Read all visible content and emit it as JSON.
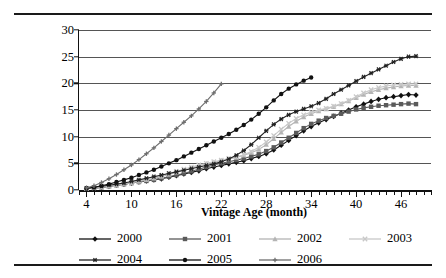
{
  "figure": {
    "ylabel": "OTS 60+DQ% (including foreclosure, REO, and bankruptcy)",
    "xlabel": "Vintage Age (month)"
  },
  "chart_data": {
    "type": "line",
    "title": "",
    "subtitle": "",
    "xlabel": "Vintage Age (month)",
    "ylabel": "OTS 60+DQ% (including foreclosure, REO, and bankruptcy)",
    "xlim": [
      3,
      50
    ],
    "ylim": [
      0,
      30
    ],
    "yticks": [
      0,
      5,
      10,
      15,
      20,
      25,
      30
    ],
    "xticks_major": [
      4,
      10,
      16,
      22,
      28,
      34,
      40,
      46
    ],
    "xtick_minor_step": 1,
    "grid": "horizontal",
    "legend_position": "bottom",
    "legend_entries": [
      "2000",
      "2001",
      "2002",
      "2003",
      "2004",
      "2005",
      "2006"
    ],
    "series": [
      {
        "name": "2000",
        "marker": "diamond",
        "color": "#111111",
        "x": [
          4,
          5,
          6,
          7,
          8,
          9,
          10,
          11,
          12,
          13,
          14,
          15,
          16,
          17,
          18,
          19,
          20,
          21,
          22,
          23,
          24,
          25,
          26,
          27,
          28,
          29,
          30,
          31,
          32,
          33,
          34,
          35,
          36,
          37,
          38,
          39,
          40,
          41,
          42,
          43,
          44,
          45,
          46,
          47,
          48
        ],
        "values": [
          0.3,
          0.4,
          0.5,
          0.7,
          0.9,
          1.1,
          1.3,
          1.5,
          1.7,
          1.9,
          2.1,
          2.4,
          2.7,
          3.0,
          3.3,
          3.6,
          4.0,
          4.3,
          4.6,
          4.9,
          5.2,
          5.5,
          5.9,
          6.3,
          6.8,
          7.5,
          8.4,
          9.3,
          10.2,
          11.1,
          11.9,
          12.6,
          13.2,
          13.8,
          14.4,
          15.0,
          15.6,
          16.1,
          16.6,
          17.0,
          17.3,
          17.5,
          17.7,
          17.9,
          17.8
        ]
      },
      {
        "name": "2001",
        "marker": "square",
        "color": "#5a5a5a",
        "x": [
          4,
          5,
          6,
          7,
          8,
          9,
          10,
          11,
          12,
          13,
          14,
          15,
          16,
          17,
          18,
          19,
          20,
          21,
          22,
          23,
          24,
          25,
          26,
          27,
          28,
          29,
          30,
          31,
          32,
          33,
          34,
          35,
          36,
          37,
          38,
          39,
          40,
          41,
          42,
          43,
          44,
          45,
          46,
          47,
          48
        ],
        "values": [
          0.3,
          0.4,
          0.5,
          0.7,
          0.9,
          1.1,
          1.3,
          1.5,
          1.7,
          1.9,
          2.2,
          2.5,
          2.8,
          3.1,
          3.5,
          3.9,
          4.3,
          4.7,
          5.0,
          5.3,
          5.6,
          5.9,
          6.3,
          6.7,
          7.3,
          8.0,
          8.9,
          9.8,
          10.7,
          11.6,
          12.4,
          13.0,
          13.5,
          13.9,
          14.3,
          14.7,
          15.1,
          15.4,
          15.6,
          15.8,
          15.9,
          16.0,
          16.1,
          16.2,
          16.1
        ]
      },
      {
        "name": "2002",
        "marker": "triangle",
        "color": "#b4b4b4",
        "x": [
          4,
          5,
          6,
          7,
          8,
          9,
          10,
          11,
          12,
          13,
          14,
          15,
          16,
          17,
          18,
          19,
          20,
          21,
          22,
          23,
          24,
          25,
          26,
          27,
          28,
          29,
          30,
          31,
          32,
          33,
          34,
          35,
          36,
          37,
          38,
          39,
          40,
          41,
          42,
          43,
          44,
          45,
          46,
          47,
          48
        ],
        "values": [
          0.3,
          0.4,
          0.5,
          0.7,
          0.9,
          1.1,
          1.3,
          1.6,
          1.9,
          2.2,
          2.5,
          2.9,
          3.3,
          3.7,
          4.1,
          4.5,
          4.9,
          5.2,
          5.5,
          5.8,
          6.1,
          6.5,
          7.0,
          7.6,
          8.5,
          9.6,
          10.8,
          11.9,
          12.9,
          13.7,
          14.3,
          14.8,
          15.2,
          15.6,
          16.1,
          16.7,
          17.3,
          17.9,
          18.4,
          18.8,
          19.1,
          19.3,
          19.5,
          19.6,
          19.6
        ]
      },
      {
        "name": "2003",
        "marker": "x",
        "color": "#c8c8c8",
        "x": [
          4,
          5,
          6,
          7,
          8,
          9,
          10,
          11,
          12,
          13,
          14,
          15,
          16,
          17,
          18,
          19,
          20,
          21,
          22,
          23,
          24,
          25,
          26,
          27,
          28,
          29,
          30,
          31,
          32,
          33,
          34,
          35,
          36,
          37,
          38,
          39,
          40,
          41,
          42,
          43,
          44,
          45,
          46,
          47,
          48
        ],
        "values": [
          0.3,
          0.4,
          0.6,
          0.8,
          1.0,
          1.2,
          1.5,
          1.8,
          2.1,
          2.4,
          2.7,
          3.1,
          3.5,
          3.9,
          4.3,
          4.7,
          5.0,
          5.3,
          5.6,
          5.9,
          6.2,
          6.6,
          7.2,
          8.0,
          9.0,
          10.2,
          11.4,
          12.5,
          13.4,
          14.1,
          14.6,
          15.0,
          15.3,
          15.7,
          16.2,
          16.8,
          17.5,
          18.2,
          18.8,
          19.2,
          19.5,
          19.7,
          19.8,
          19.9,
          19.9
        ]
      },
      {
        "name": "2004",
        "marker": "asterisk",
        "color": "#222222",
        "x": [
          4,
          5,
          6,
          7,
          8,
          9,
          10,
          11,
          12,
          13,
          14,
          15,
          16,
          17,
          18,
          19,
          20,
          21,
          22,
          23,
          24,
          25,
          26,
          27,
          28,
          29,
          30,
          31,
          32,
          33,
          34,
          35,
          36,
          37,
          38,
          39,
          40,
          41,
          42,
          43,
          44,
          45,
          46,
          47,
          48
        ],
        "values": [
          0.3,
          0.5,
          0.7,
          0.9,
          1.1,
          1.3,
          1.6,
          1.9,
          2.2,
          2.5,
          2.8,
          3.1,
          3.4,
          3.7,
          4.0,
          4.3,
          4.6,
          4.9,
          5.3,
          5.8,
          6.5,
          7.4,
          8.5,
          9.8,
          11.1,
          12.3,
          13.3,
          14.1,
          14.7,
          15.2,
          15.7,
          16.3,
          17.1,
          18.0,
          18.8,
          19.6,
          20.4,
          21.2,
          21.9,
          22.6,
          23.3,
          24.0,
          24.6,
          25.0,
          25.1
        ]
      },
      {
        "name": "2005",
        "marker": "circle",
        "color": "#111111",
        "x": [
          4,
          5,
          6,
          7,
          8,
          9,
          10,
          11,
          12,
          13,
          14,
          15,
          16,
          17,
          18,
          19,
          20,
          21,
          22,
          23,
          24,
          25,
          26,
          27,
          28,
          29,
          30,
          31,
          32,
          33,
          34
        ],
        "values": [
          0.3,
          0.5,
          0.8,
          1.1,
          1.5,
          1.9,
          2.3,
          2.8,
          3.3,
          3.8,
          4.4,
          5.0,
          5.6,
          6.3,
          7.0,
          7.7,
          8.4,
          9.1,
          9.8,
          10.5,
          11.3,
          12.2,
          13.2,
          14.3,
          15.5,
          16.8,
          18.0,
          19.0,
          19.8,
          20.5,
          21.1
        ]
      },
      {
        "name": "2006",
        "marker": "plus",
        "color": "#6e6e6e",
        "x": [
          4,
          5,
          6,
          7,
          8,
          9,
          10,
          11,
          12,
          13,
          14,
          15,
          16,
          17,
          18,
          19,
          20,
          21,
          22
        ],
        "values": [
          0.4,
          0.8,
          1.4,
          2.1,
          2.9,
          3.8,
          4.7,
          5.7,
          6.8,
          7.9,
          9.1,
          10.3,
          11.5,
          12.7,
          13.9,
          15.2,
          16.6,
          18.2,
          19.9
        ]
      }
    ]
  }
}
